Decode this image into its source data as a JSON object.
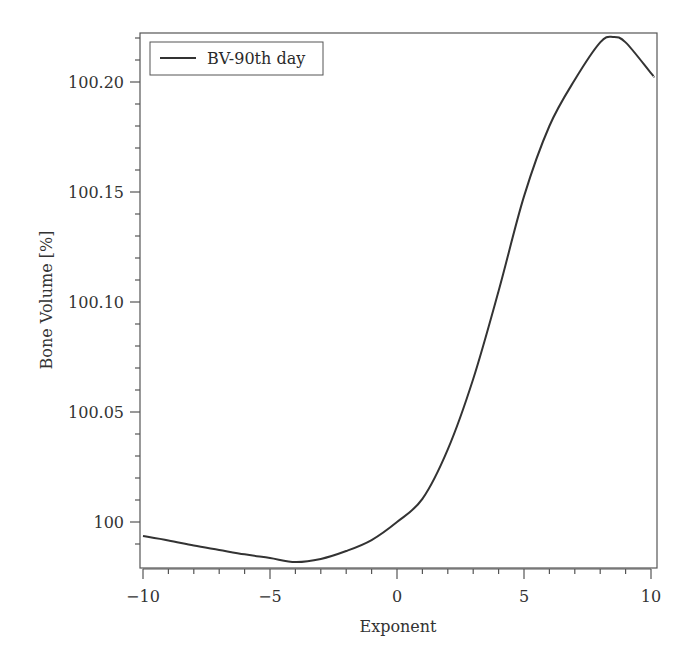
{
  "chart_data": {
    "type": "line",
    "title": "",
    "xlabel": "Exponent",
    "ylabel": "Bone Volume [%]",
    "xlim": [
      -10,
      10.3
    ],
    "ylim": [
      99.979,
      100.222
    ],
    "grid": false,
    "legend_position": "upper left",
    "x_ticks": [
      -10,
      -5,
      0,
      5,
      10
    ],
    "x_tick_labels": [
      "−10",
      "−5",
      "0",
      "5",
      "10"
    ],
    "y_ticks": [
      100.0,
      100.05,
      100.1,
      100.15,
      100.2
    ],
    "y_tick_labels": [
      "100",
      "100.05",
      "100.10",
      "100.15",
      "100.20"
    ],
    "series": [
      {
        "name": "BV-90th day",
        "color": "#333333",
        "x": [
          -10,
          -9,
          -8,
          -7,
          -6,
          -5,
          -4,
          -3,
          -2,
          -1,
          0,
          1,
          2,
          3,
          4,
          5,
          6,
          7,
          8,
          8.5,
          9,
          10,
          10.1
        ],
        "y": [
          99.9936,
          99.9916,
          99.9893,
          99.9873,
          99.9853,
          99.9836,
          99.9818,
          99.9832,
          99.9868,
          99.9918,
          100.0,
          100.0105,
          100.033,
          100.065,
          100.105,
          100.148,
          100.18,
          100.201,
          100.218,
          100.2205,
          100.218,
          100.204,
          100.2027
        ]
      }
    ]
  },
  "legend": {
    "label": "BV-90th day"
  }
}
